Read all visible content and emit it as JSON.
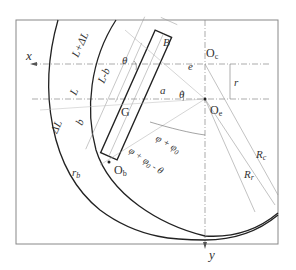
{
  "diagram": {
    "labels": {
      "x_axis": "x",
      "y_axis": "y",
      "Oc": "O",
      "Oc_sub": "c",
      "Oe": "O",
      "Oe_sub": "e",
      "Ob": "O",
      "Ob_sub": "b",
      "B": "B",
      "e": "e",
      "r": "r",
      "a": "a",
      "theta_top": "θ",
      "theta_mid": "θ",
      "L_plus_dL": "L+ΔL",
      "L": "L",
      "L_minus_b": "L-b",
      "b": "b",
      "dL": "ΔL",
      "G": "G",
      "rb": "r",
      "rb_sub": "b",
      "phi_phi0": "φ + φ",
      "phi_phi0_sub": "0",
      "phi_phi0_theta": "φ + φ",
      "phi_phi0_theta_sub": "0",
      "phi_phi0_theta_tail": " - θ",
      "Rc": "R",
      "Rc_sub": "c",
      "Rr": "R",
      "Rr_sub": "r"
    },
    "colors": {
      "frame": "#888888",
      "thick": "#222222",
      "thin": "#999999",
      "dash": "#888888"
    }
  }
}
